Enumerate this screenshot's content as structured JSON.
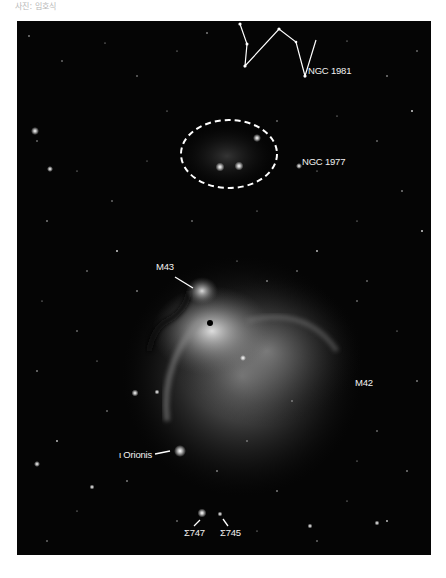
{
  "caption": "사진: 임호식",
  "photo": {
    "subject": "Orion Nebula region",
    "colors": {
      "background": "#050505",
      "annotation": "#f2f2f2"
    },
    "labels": {
      "ngc1981": "NGC 1981",
      "ngc1977": "NGC 1977",
      "m43": "M43",
      "m42": "M42",
      "iota_orionis": "ι Orionis",
      "sigma747": "Σ747",
      "sigma745": "Σ745"
    }
  }
}
